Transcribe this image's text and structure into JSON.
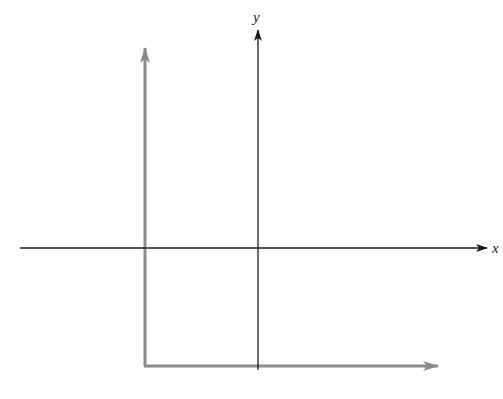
{
  "diagram": {
    "type": "coordinate-axes",
    "colors": {
      "main_axes": "#1a1a1a",
      "shifted_axes": "#8a8a8a",
      "background": "#ffffff"
    },
    "main_axes": {
      "x_label": "x",
      "y_label": "y",
      "origin": [
        258,
        248
      ],
      "x_axis": {
        "from": [
          20,
          248
        ],
        "to": [
          487,
          248
        ]
      },
      "y_axis": {
        "from": [
          258,
          370
        ],
        "to": [
          258,
          30
        ]
      }
    },
    "shifted_axes": {
      "origin": [
        145,
        366
      ],
      "vertical": {
        "from": [
          145,
          366
        ],
        "to": [
          145,
          48
        ]
      },
      "horizontal": {
        "from": [
          145,
          366
        ],
        "to": [
          438,
          366
        ]
      }
    }
  }
}
